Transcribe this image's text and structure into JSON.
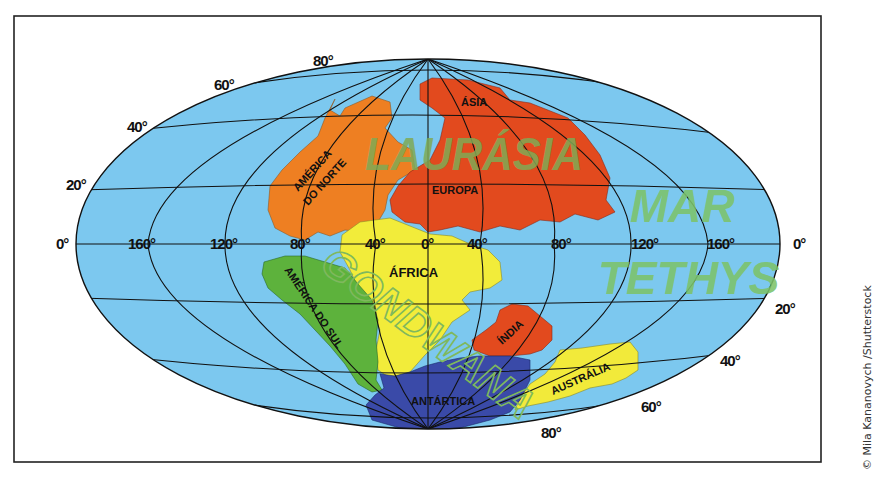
{
  "map": {
    "title": "",
    "colors": {
      "ocean": "#7cc8ef",
      "north_america": "#ee7f22",
      "eurasia": "#e24a1e",
      "africa": "#f2ec3a",
      "south_america": "#5db23c",
      "india": "#e24a1e",
      "australia": "#f2ea3a",
      "antarctica": "#3a4aa8",
      "supercontinent_text": "#7faa55",
      "sea_text": "#7cc36a"
    },
    "supercontinents": {
      "laurasia": "LAURÁSIA",
      "gondwana": "GONDWANA"
    },
    "sea": {
      "line1": "MAR",
      "line2": "TETHYS"
    },
    "continents": {
      "north_america_line1": "AMÉRICA",
      "north_america_line2": "DO NORTE",
      "asia": "ÁSIA",
      "europe": "EUROPA",
      "africa": "ÁFRICA",
      "south_america": "AMÉRICA DO SUL",
      "india": "ÍNDIA",
      "australia": "AUSTRÁLIA",
      "antarctica": "ANTÁRTICA"
    },
    "longitude_labels": {
      "w160": "160°",
      "w120": "120°",
      "w80": "80°",
      "w40": "40°",
      "zero": "0°",
      "e40": "40°",
      "e80": "80°",
      "e120": "120°",
      "e160": "160°",
      "left_edge": "0°",
      "right_edge": "0°"
    },
    "latitude_labels": {
      "n20": "20°",
      "n40": "40°",
      "n60": "60°",
      "n80": "80°",
      "s20": "20°",
      "s40": "40°",
      "s60": "60°",
      "s80": "80°"
    }
  },
  "credit": "© Mila Kananovych /Shutterstock"
}
